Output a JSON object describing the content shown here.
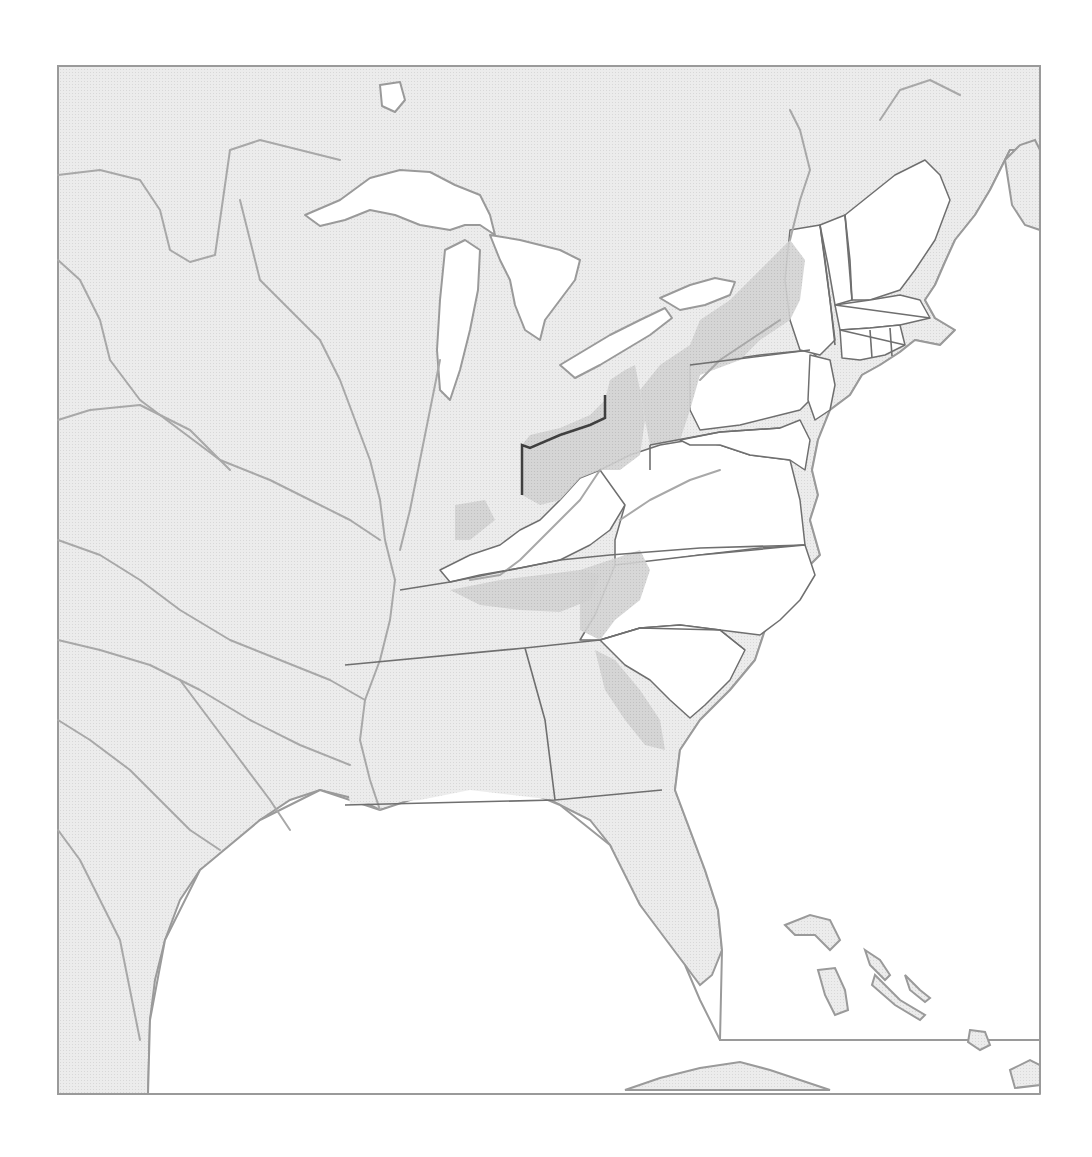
{
  "map": {
    "frame": {
      "x": 58,
      "y": 66,
      "width": 982,
      "height": 1028
    },
    "colors": {
      "page_background": "#ffffff",
      "water": "#ffffff",
      "land_outside": "#e9e9e9",
      "state_unshaded": "#ffffff",
      "state_light": "#e2e2e2",
      "shaded_region": "#cfcfcf",
      "coastline": "#9a9a9a",
      "river": "#a8a8a8",
      "state_border": "#6f6f6f",
      "ohio_border": "#3f3f3f"
    },
    "land_outline": "M58,66 L1040,66 L1040,150 L1010,150 L1000,170 L990,190 L975,215 L955,240 L945,262 L935,285 L925,300 L935,318 L955,330 L940,345 L915,340 L900,352 L880,365 L862,375 L850,395 L830,410 L818,440 L812,470 L818,495 L810,520 L820,555 L800,575 L780,600 L765,630 L755,660 L730,690 L700,720 L680,750 L675,790 L690,830 L705,870 L718,910 L722,950 L712,975 L700,985 L685,965 L660,935 L640,905 L625,880 L610,845 L590,820 L560,805 L530,790 L500,780 L470,778 L440,790 L420,800 L400,805 L380,810 L360,800 L340,795 L320,790 L290,800 L260,820 L230,850 L200,870 L180,900 L165,940 L155,980 L150,1020 L148,1094 L58,1094 Z",
    "lakes": [
      {
        "name": "lake-superior",
        "d": "M305,215 L340,200 L370,178 L400,170 L430,172 L455,185 L480,195 L490,215 L495,235 L480,225 L465,225 L450,230 L420,225 L395,215 L370,210 L345,220 L320,226 Z"
      },
      {
        "name": "lake-michigan",
        "d": "M445,250 L465,240 L480,250 L478,290 L470,330 L460,370 L450,400 L440,390 L437,350 L440,300 Z"
      },
      {
        "name": "lake-huron",
        "d": "M490,235 L520,240 L560,250 L580,260 L575,280 L560,300 L545,320 L540,340 L525,330 L515,305 L510,280 L500,260 Z"
      },
      {
        "name": "lake-erie",
        "d": "M560,365 L585,350 L610,335 L640,320 L665,308 L672,318 L650,335 L625,350 L600,365 L575,378 Z"
      },
      {
        "name": "lake-ontario",
        "d": "M660,298 L690,285 L715,278 L735,282 L730,295 L705,305 L680,310 Z"
      },
      {
        "name": "lake-winnipeg-fragment",
        "d": "M380,85 L400,82 L405,100 L395,112 L382,106 Z"
      },
      {
        "name": "gulf-of-mexico",
        "d": "M148,1094 L150,1020 L165,940 L200,870 L260,820 L320,790 L380,810 L440,790 L500,780 L560,805 L610,845 L640,905 L685,965 L700,1000 L720,1040 L1040,1040 L1040,1094 Z"
      },
      {
        "name": "atlantic-ocean",
        "d": "M1040,150 L1040,1040 L720,1040 L722,950 L718,910 L705,870 L690,830 L675,790 L680,750 L700,720 L730,690 L755,660 L765,630 L780,600 L800,575 L820,555 L810,520 L818,495 L812,470 L818,440 L830,410 L850,395 L862,375 L880,365 L900,352 L915,340 L940,345 L955,330 L935,318 L925,300 L935,285 L945,262 L955,240 L975,215 L990,190 L1000,170 L1010,150 Z"
      }
    ],
    "states_white": [
      {
        "name": "kentucky",
        "d": "M440,570 L470,555 L500,545 L520,530 L540,520 L560,500 L580,478 L600,470 L615,480 L625,505 L610,530 L590,545 L560,560 L520,568 L480,575 L450,582 Z"
      },
      {
        "name": "virginia-west",
        "d": "M600,470 L630,455 L660,445 L690,440 L720,445 L750,455 L790,460 L800,500 L805,545 L760,548 L700,555 L650,562 L615,565 L615,540 L625,505 Z"
      },
      {
        "name": "north-carolina",
        "d": "M615,565 L700,555 L805,545 L815,575 L800,600 L780,620 L760,635 L720,630 L680,625 L640,628 L600,640 L580,640 L595,615 Z"
      },
      {
        "name": "south-carolina",
        "d": "M600,640 L640,628 L680,625 L720,630 L745,650 L730,680 L705,705 L690,718 L670,700 L650,680 L625,665 Z"
      },
      {
        "name": "pennsylvania-east",
        "d": "M690,365 L760,355 L810,350 L820,360 L815,395 L800,410 L780,415 L740,425 L700,430 L690,410 Z"
      },
      {
        "name": "new-jersey",
        "d": "M810,355 L830,360 L835,385 L830,410 L815,420 L808,400 Z"
      },
      {
        "name": "maryland-delaware",
        "d": "M680,440 L720,432 L780,428 L800,420 L810,440 L805,470 L790,460 L750,455 L720,445 L690,445 Z"
      },
      {
        "name": "new-york-east",
        "d": "M790,230 L820,225 L825,260 L830,300 L835,340 L820,355 L800,350 L790,320 L785,280 Z"
      },
      {
        "name": "vermont",
        "d": "M820,225 L845,215 L850,260 L852,300 L835,305 L828,265 Z"
      },
      {
        "name": "new-hampshire-maine",
        "d": "M845,215 L870,195 L895,175 L925,160 L940,175 L950,200 L935,240 L915,270 L900,290 L870,300 L852,300 L850,260 Z"
      },
      {
        "name": "massachusetts",
        "d": "M835,305 L870,300 L900,295 L920,300 L930,318 L900,325 L870,328 L840,330 Z"
      },
      {
        "name": "connecticut-rhode-island",
        "d": "M840,330 L870,328 L900,325 L905,345 L885,355 L860,360 L842,358 Z"
      }
    ],
    "states_light": [
      {
        "name": "indiana",
        "d": "M455,455 L520,450 L522,545 L500,545 L470,555 L455,540 Z"
      },
      {
        "name": "tennessee",
        "d": "M400,590 L450,582 L520,568 L560,560 L600,560 L610,575 L590,610 L560,630 L525,645 L470,652 L420,658 L400,660 Z"
      },
      {
        "name": "mississippi-territory",
        "d": "M345,665 L420,658 L525,648 L545,720 L555,800 L470,790 L420,800 L350,805 L345,760 Z"
      },
      {
        "name": "georgia",
        "d": "M525,648 L600,640 L625,665 L650,680 L670,700 L690,718 L675,760 L662,790 L555,800 L545,720 Z"
      }
    ],
    "shaded_regions": [
      {
        "name": "ohio",
        "d": "M522,445 L530,435 L560,428 L590,415 L605,400 L610,380 L625,370 L635,365 L640,390 L645,420 L640,455 L620,470 L600,470 L580,478 L560,500 L540,505 L522,495 Z"
      },
      {
        "name": "western-new-york-pennsylvania",
        "d": "M640,390 L660,365 L690,345 L700,320 L730,300 L760,270 L790,240 L805,260 L800,300 L790,320 L760,340 L740,360 L700,375 L690,410 L680,440 L650,445 L645,420 Z"
      },
      {
        "name": "southern-indiana",
        "d": "M455,505 L485,500 L495,520 L470,540 L455,540 Z"
      },
      {
        "name": "tennessee-valley",
        "d": "M450,590 L500,580 L540,575 L580,570 L600,575 L590,600 L560,612 L520,610 L480,605 Z"
      },
      {
        "name": "appalachian-strip",
        "d": "M580,570 L610,560 L640,550 L650,570 L640,600 L615,620 L600,640 L580,630 Z"
      },
      {
        "name": "georgia-frontier",
        "d": "M595,650 L615,660 L640,690 L660,720 L665,750 L645,745 L625,720 L605,690 Z"
      }
    ],
    "state_borders": [
      "M345,665 L525,648 L600,640",
      "M525,648 L545,720 L555,800",
      "M345,805 L555,800 L662,790",
      "M400,590 L450,582 L520,568 L560,560 L610,555 L700,548 L805,545",
      "M600,640 L640,628 L720,630 L745,650",
      "M650,445 L650,470",
      "M650,445 L720,432 L780,428",
      "M690,365 L810,350",
      "M820,225 L830,300 L835,345",
      "M845,215 L852,300",
      "M835,305 L930,318",
      "M840,330 L905,345",
      "M870,330 L872,358",
      "M890,328 L892,356"
    ],
    "ohio_border": "M522,495 L522,445 L530,448 L560,435 L590,425 L605,418 L605,395",
    "rivers": [
      "M58,175 L100,170 L140,180 L160,210 L170,250 L190,262 L215,255 L220,220 L230,150 L260,140 L300,150 L340,160",
      "M240,200 L250,240 L260,280 L290,310 L320,340 L340,380 L355,420 L370,460 L380,500 L385,540 L395,580 L390,620 L380,660 L365,700 L360,740 L370,780 L380,810",
      "M58,260 L80,280 L100,320 L110,360 L140,400 L180,430 L220,460 L270,480 L310,500 L350,520 L380,540",
      "M58,420 L90,410 L140,405 L190,430 L230,470",
      "M58,540 L100,555 L140,580 L180,610 L230,640 L280,660 L330,680 L365,700",
      "M58,640 L100,650 L150,665 L200,690 L250,720 L300,745 L350,765",
      "M58,720 L90,740 L130,770 L160,800 L190,830 L220,850",
      "M58,830 L80,860 L100,900 L120,940 L130,990 L140,1040",
      "M180,680 L210,720 L240,760 L270,800 L290,830",
      "M440,360 L430,410 L420,460 L410,510 L400,550",
      "M600,470 L580,500 L560,520 L540,540 L520,560 L500,575 L470,580",
      "M620,520 L650,500 L690,480 L720,470",
      "M700,380 L720,360 L750,340 L780,320",
      "M790,240 L800,200 L810,170 L800,130 L790,110",
      "M880,120 L900,90 L930,80 L960,95"
    ],
    "islands": [
      {
        "name": "cuba",
        "d": "M625,1090 L660,1078 L700,1068 L740,1062 L770,1070 L800,1080 L830,1090 Z"
      },
      {
        "name": "bahamas-andros",
        "d": "M818,970 L835,968 L845,990 L848,1010 L835,1015 L825,995 Z"
      },
      {
        "name": "bahamas-abaco",
        "d": "M785,925 L810,915 L830,920 L840,940 L830,950 L815,935 L795,935 Z"
      },
      {
        "name": "bahamas-eleuthera",
        "d": "M865,950 L880,960 L890,975 L885,980 L870,965 Z"
      },
      {
        "name": "bahamas-long",
        "d": "M875,975 L900,1000 L925,1015 L920,1020 L895,1005 L872,985 Z"
      },
      {
        "name": "bahamas-exuma",
        "d": "M905,975 L920,990 L930,998 L925,1002 L910,990 Z"
      },
      {
        "name": "bahamas-inagua",
        "d": "M970,1030 L985,1032 L990,1045 L980,1050 L968,1042 Z"
      },
      {
        "name": "hispaniola-tip",
        "d": "M1010,1070 L1030,1060 L1040,1065 L1040,1085 L1015,1088 Z"
      },
      {
        "name": "nova-scotia",
        "d": "M1005,160 L1020,145 L1035,140 L1040,150 L1040,230 L1025,225 L1012,205 Z"
      }
    ]
  }
}
